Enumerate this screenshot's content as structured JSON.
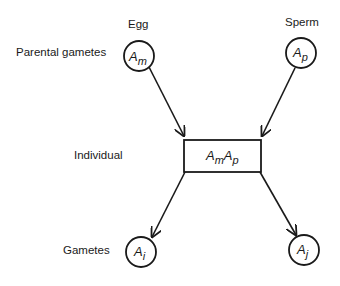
{
  "labels": {
    "egg": "Egg",
    "sperm": "Sperm",
    "parental_gametes": "Parental gametes",
    "individual": "Individual",
    "gametes": "Gametes"
  },
  "nodes": {
    "maternal": {
      "base": "A",
      "sub": "m"
    },
    "paternal": {
      "base": "A",
      "sub": "p"
    },
    "individual": {
      "base1": "A",
      "sub1": "m",
      "base2": "A",
      "sub2": "p"
    },
    "gamete_i": {
      "base": "A",
      "sub": "i"
    },
    "gamete_j": {
      "base": "A",
      "sub": "j"
    }
  },
  "colors": {
    "stroke": "#1a1a1a",
    "background": "#ffffff"
  }
}
